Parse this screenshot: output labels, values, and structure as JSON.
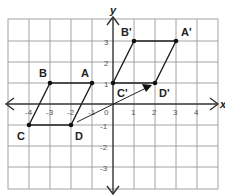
{
  "diagram": {
    "title": "",
    "grid": {
      "xmin": -5,
      "xmax": 5,
      "ymin": -4,
      "ymax": 4,
      "unit_px": 21,
      "origin_px": [
        113,
        104
      ]
    },
    "axes": {
      "x_label": "x",
      "y_label": "y"
    },
    "x_ticks": [
      "-4",
      "-3",
      "-2",
      "-1",
      "0",
      "1",
      "2",
      "3",
      "4"
    ],
    "y_ticks": [
      "3",
      "2",
      "1",
      "-1",
      "-2",
      "-3"
    ],
    "original": {
      "points": [
        {
          "name": "A",
          "x": -1,
          "y": 1
        },
        {
          "name": "B",
          "x": -3,
          "y": 1
        },
        {
          "name": "C",
          "x": -4,
          "y": -1
        },
        {
          "name": "D",
          "x": -2,
          "y": -1
        }
      ]
    },
    "image": {
      "points": [
        {
          "name": "A'",
          "x": 3,
          "y": 3
        },
        {
          "name": "B'",
          "x": 1,
          "y": 3
        },
        {
          "name": "C'",
          "x": 0,
          "y": 1
        },
        {
          "name": "D'",
          "x": 2,
          "y": 1
        }
      ]
    },
    "translation_arrow": {
      "from": "D",
      "to": "D'"
    },
    "colors": {
      "grid": "#9a9a9a",
      "axis": "#333333",
      "shape": "#222222"
    }
  }
}
